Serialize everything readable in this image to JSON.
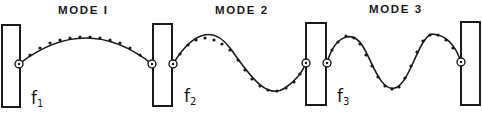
{
  "modes": [
    {
      "label": "MODE I",
      "frequency_label": "f",
      "frequency_sub": "1",
      "half_waves": 1
    },
    {
      "label": "MODE 2",
      "frequency_label": "f",
      "frequency_sub": "2",
      "half_waves": 2
    },
    {
      "label": "MODE 3",
      "frequency_label": "f",
      "frequency_sub": "3",
      "half_waves": 3
    }
  ],
  "colors": {
    "ink": "#1a1a1a",
    "background": "#ffffff"
  }
}
